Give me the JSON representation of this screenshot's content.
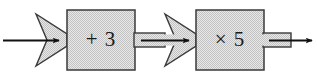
{
  "diagram": {
    "type": "function-machine-flowchart",
    "background_color": "#ffffff",
    "fill_color": "#d9d9d9",
    "stroke_color": "#3a3a3a",
    "arrow_color": "#111111",
    "input": {
      "label": "",
      "arrow_name": "input-arrow"
    },
    "machines": [
      {
        "id": "machine-add",
        "operation": "+ 3",
        "operator": "+",
        "operand": "3"
      },
      {
        "id": "machine-multiply",
        "operation": "× 5",
        "operator": "×",
        "operand": "5"
      }
    ],
    "connectors": [
      {
        "id": "connector-input",
        "kind": "block-arrow-wedge"
      },
      {
        "id": "connector-middle",
        "kind": "block-arrow-wedge"
      },
      {
        "id": "connector-output",
        "kind": "block-stub"
      }
    ],
    "output": {
      "label": "",
      "arrow_name": "output-arrow"
    }
  }
}
